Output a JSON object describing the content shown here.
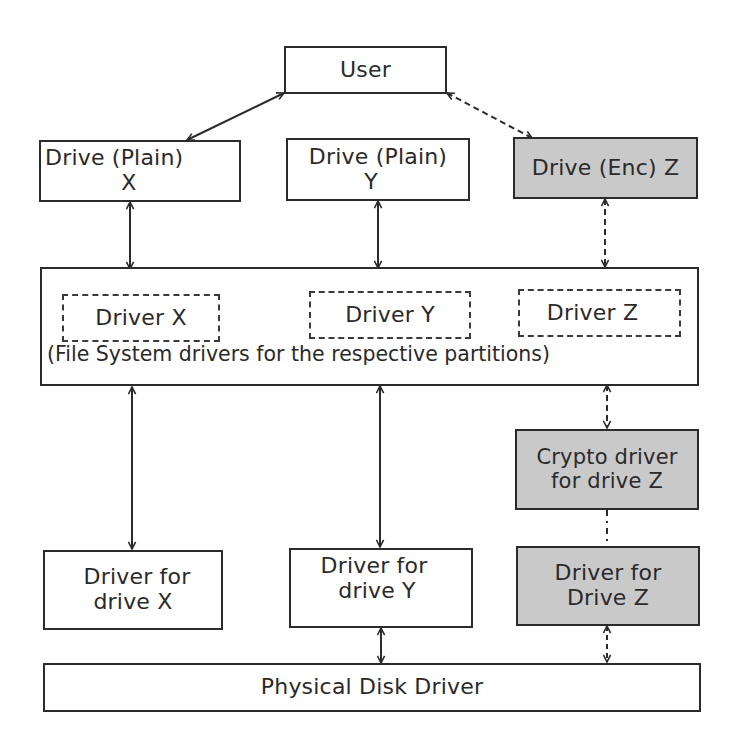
{
  "diagram": {
    "title": "",
    "colors": {
      "plain_fill": "#ffffff",
      "encrypted_fill": "#c9c9c9",
      "stroke": "#2b2b2b",
      "text": "#2a2a2a"
    },
    "nodes": {
      "user": {
        "label": "User"
      },
      "drive_x": {
        "line1": "Drive (Plain)",
        "line2": "X"
      },
      "drive_y": {
        "line1": "Drive (Plain)",
        "line2": "Y"
      },
      "drive_z": {
        "line1": "Drive (Enc) Z"
      },
      "fs_layer": {
        "caption": "(File System drivers for the respective partitions)"
      },
      "fs_driver_x": {
        "label": "Driver X"
      },
      "fs_driver_y": {
        "label": "Driver Y"
      },
      "fs_driver_z": {
        "label": "Driver Z"
      },
      "crypto_z": {
        "line1": "Crypto driver",
        "line2": "for drive Z"
      },
      "driver_drive_x": {
        "line1": "Driver for",
        "line2": "drive X"
      },
      "driver_drive_y": {
        "line1": "Driver for",
        "line2": "drive Y"
      },
      "driver_drive_z": {
        "line1": "Driver for",
        "line2": "Drive Z"
      },
      "physical_disk": {
        "label": "Physical Disk Driver"
      }
    },
    "edges": [
      {
        "from": "user",
        "to": "drive_x",
        "style": "solid",
        "direction": "bidirectional"
      },
      {
        "from": "user",
        "to": "drive_z",
        "style": "dashed",
        "direction": "bidirectional"
      },
      {
        "from": "drive_x",
        "to": "fs_layer",
        "style": "solid",
        "direction": "bidirectional"
      },
      {
        "from": "drive_y",
        "to": "fs_layer",
        "style": "solid",
        "direction": "bidirectional"
      },
      {
        "from": "drive_z",
        "to": "fs_layer",
        "style": "dashed",
        "direction": "bidirectional"
      },
      {
        "from": "fs_layer",
        "to": "driver_drive_x",
        "style": "solid",
        "direction": "bidirectional"
      },
      {
        "from": "fs_layer",
        "to": "driver_drive_y",
        "style": "solid",
        "direction": "bidirectional"
      },
      {
        "from": "fs_layer",
        "to": "crypto_z",
        "style": "dashed",
        "direction": "bidirectional"
      },
      {
        "from": "crypto_z",
        "to": "driver_drive_z",
        "style": "dash-dot",
        "direction": "none"
      },
      {
        "from": "driver_drive_y",
        "to": "physical_disk",
        "style": "solid",
        "direction": "bidirectional"
      },
      {
        "from": "driver_drive_z",
        "to": "physical_disk",
        "style": "dashed",
        "direction": "bidirectional"
      }
    ]
  }
}
